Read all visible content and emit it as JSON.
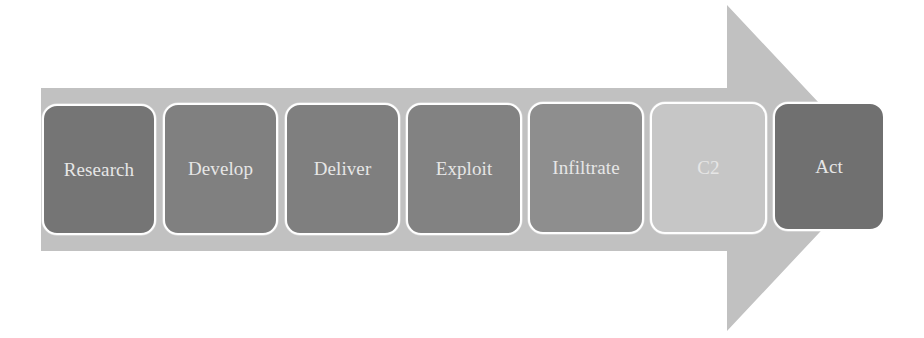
{
  "diagram": {
    "type": "process-arrow",
    "arrow": {
      "color": "#c1c1c1",
      "icon": "right-arrow-shape"
    },
    "steps": [
      {
        "label": "Research",
        "color": "#757575",
        "x": 42,
        "y": 104,
        "w": 114,
        "h": 131
      },
      {
        "label": "Develop",
        "color": "#808080",
        "x": 163,
        "y": 103,
        "w": 115,
        "h": 132
      },
      {
        "label": "Deliver",
        "color": "#7f7f7f",
        "x": 285,
        "y": 103,
        "w": 115,
        "h": 132
      },
      {
        "label": "Exploit",
        "color": "#828282",
        "x": 406,
        "y": 103,
        "w": 116,
        "h": 132
      },
      {
        "label": "Infiltrate",
        "color": "#8e8e8e",
        "x": 528,
        "y": 102,
        "w": 116,
        "h": 132
      },
      {
        "label": "C2",
        "color": "#c6c6c6",
        "x": 650,
        "y": 102,
        "w": 117,
        "h": 132
      },
      {
        "label": "Act",
        "color": "#707070",
        "x": 773,
        "y": 102,
        "w": 112,
        "h": 129
      }
    ]
  }
}
